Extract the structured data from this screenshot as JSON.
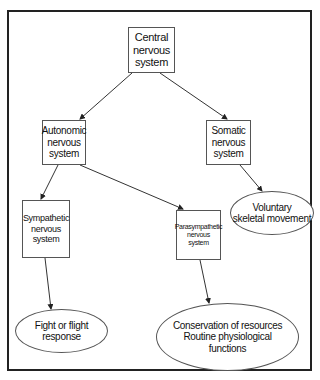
{
  "diagram": {
    "type": "hierarchy",
    "nodes": {
      "central": {
        "label": "Central\nnervous\nsystem",
        "shape": "box"
      },
      "autonomic": {
        "label": "Autonomic\nnervous\nsystem",
        "shape": "box"
      },
      "somatic": {
        "label": "Somatic\nnervous\nsystem",
        "shape": "box"
      },
      "sympathetic": {
        "label": "Sympathetic\nnervous\nsystem",
        "shape": "box"
      },
      "parasympathetic": {
        "label": "Parasympathetic\nnervous\nsystem",
        "shape": "box"
      },
      "voluntary": {
        "label": "Voluntary\nskeletal movement",
        "shape": "ellipse"
      },
      "fight_flight": {
        "label": "Fight or flight\nresponse",
        "shape": "ellipse"
      },
      "conservation": {
        "label": "Conservation of resources\nRoutine physiological\nfunctions",
        "shape": "ellipse"
      }
    },
    "edges": [
      {
        "from": "central",
        "to": "autonomic"
      },
      {
        "from": "central",
        "to": "somatic"
      },
      {
        "from": "autonomic",
        "to": "sympathetic"
      },
      {
        "from": "autonomic",
        "to": "parasympathetic"
      },
      {
        "from": "somatic",
        "to": "voluntary"
      },
      {
        "from": "sympathetic",
        "to": "fight_flight"
      },
      {
        "from": "parasympathetic",
        "to": "conservation"
      }
    ],
    "colors": {
      "line": "#333333",
      "frame": "#222222",
      "background": "#ffffff"
    }
  }
}
